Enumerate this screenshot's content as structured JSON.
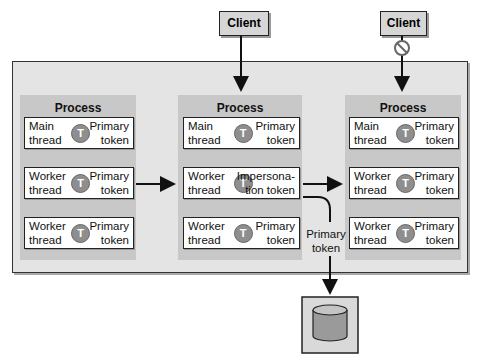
{
  "clients": [
    {
      "label": "Client",
      "blocked": false
    },
    {
      "label": "Client",
      "blocked": true
    }
  ],
  "processes": [
    {
      "title": "Process",
      "threads": [
        {
          "left": "Main\nthread",
          "right": "Primary\ntoken",
          "icon": "T"
        },
        {
          "left": "Worker\nthread",
          "right": "Primary\ntoken",
          "icon": "T"
        },
        {
          "left": "Worker\nthread",
          "right": "Primary\ntoken",
          "icon": "T"
        }
      ]
    },
    {
      "title": "Process",
      "threads": [
        {
          "left": "Main\nthread",
          "right": "Primary\ntoken",
          "icon": "T"
        },
        {
          "left": "Worker\nthread",
          "right": "Impersona-\ntion token",
          "icon": "T"
        },
        {
          "left": "Worker\nthread",
          "right": "Primary\ntoken",
          "icon": "T"
        }
      ]
    },
    {
      "title": "Process",
      "threads": [
        {
          "left": "Main\nthread",
          "right": "Primary\ntoken",
          "icon": "T"
        },
        {
          "left": "Worker\nthread",
          "right": "Primary\ntoken",
          "icon": "T"
        },
        {
          "left": "Worker\nthread",
          "right": "Primary\ntoken",
          "icon": "T"
        }
      ]
    }
  ],
  "primary_token_label": "Primary\ntoken",
  "colors": {
    "frame": "#e4e4e4",
    "process": "#c8c8c8",
    "token": "#8e8e8e",
    "client": "#d6d6d6"
  }
}
